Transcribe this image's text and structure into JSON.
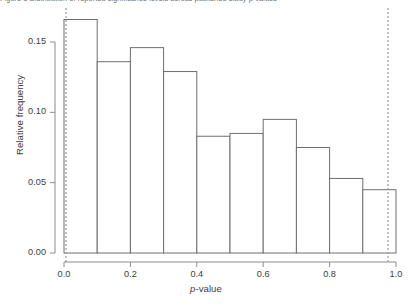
{
  "figure": {
    "caption_clipped": "Figure 1  Distribution of reported significance levels across published study p-values",
    "background_color": "#ffffff",
    "bar_stroke_color": "#6e6e6e",
    "bar_fill_color": "#ffffff",
    "axis_color": "#8c8c8c",
    "reference_line_color": "#9a9a9a"
  },
  "chart_data": {
    "type": "bar",
    "title": "",
    "subtitle": "",
    "xlabel": "p-value",
    "ylabel": "Relative frequency",
    "categories": [
      "0.0-0.1",
      "0.1-0.2",
      "0.2-0.3",
      "0.3-0.4",
      "0.4-0.5",
      "0.5-0.6",
      "0.6-0.7",
      "0.7-0.8",
      "0.8-0.9",
      "0.9-1.0"
    ],
    "bin_edges": [
      0.0,
      0.1,
      0.2,
      0.3,
      0.4,
      0.5,
      0.6,
      0.7,
      0.8,
      0.9,
      1.0
    ],
    "values": [
      0.166,
      0.136,
      0.146,
      0.129,
      0.083,
      0.085,
      0.095,
      0.075,
      0.053,
      0.045
    ],
    "xlim": [
      0.0,
      1.0
    ],
    "ylim": [
      0.0,
      0.175
    ],
    "xticks": [
      0.0,
      0.2,
      0.4,
      0.6,
      0.8,
      1.0
    ],
    "xtick_labels": [
      "0.0",
      "0.2",
      "0.4",
      "0.6",
      "0.8",
      "1.0"
    ],
    "yticks": [
      0.0,
      0.05,
      0.1,
      0.15
    ],
    "ytick_labels": [
      "0.00",
      "0.05",
      "0.10",
      "0.15"
    ],
    "grid": false,
    "legend": null,
    "annotations": [
      {
        "type": "vertical-dotted-line",
        "x": 0.0,
        "label": ""
      },
      {
        "type": "vertical-dotted-line",
        "x": 1.0,
        "label": ""
      }
    ]
  }
}
